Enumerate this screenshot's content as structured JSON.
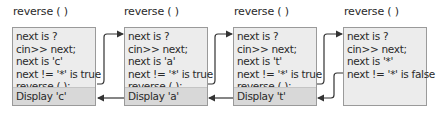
{
  "diagram": {
    "frames": [
      {
        "title": "reverse ( )",
        "lines": [
          "next is ?",
          "cin>> next;",
          "next is 'c'",
          "next != '*' is true",
          "reverse ( );"
        ],
        "display": "Display 'c'"
      },
      {
        "title": "reverse ( )",
        "lines": [
          "next is ?",
          "cin>> next;",
          "next is 'a'",
          "next != '*' is true",
          "reverse ( );"
        ],
        "display": "Display 'a'"
      },
      {
        "title": "reverse ( )",
        "lines": [
          "next is ?",
          "cin>> next;",
          "next is 't'",
          "next != '*' is true",
          "reverse ( );"
        ],
        "display": "Display 't'"
      },
      {
        "title": "reverse ( )",
        "lines": [
          "next is ?",
          "cin>> next;",
          "next is '*'",
          "next != '*' is false"
        ],
        "display": ""
      }
    ],
    "colors": {
      "box_fill": "#ececec",
      "display_fill": "#d8d8d8",
      "border": "#9a9a9a",
      "arrow": "#333333"
    }
  }
}
